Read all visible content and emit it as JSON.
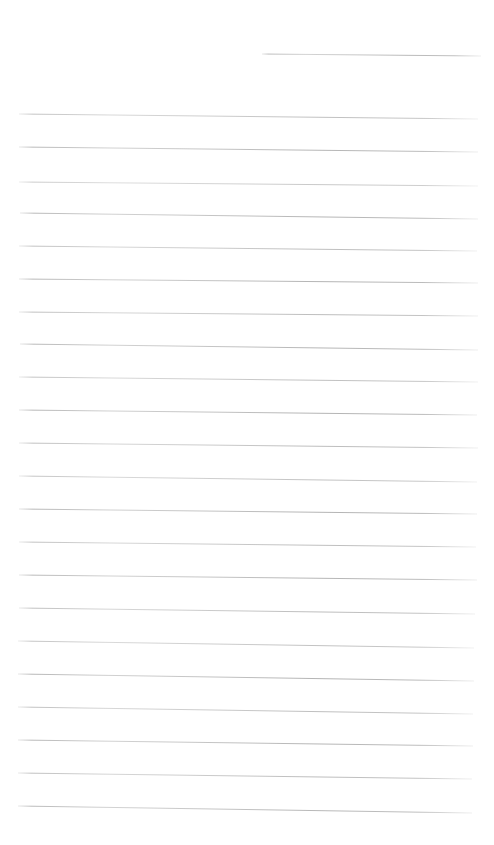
{
  "document": {
    "kind": "scanned-ruled-notebook-paper",
    "title": "Blank Ruled Paper",
    "page_width": 494,
    "page_height": 845,
    "background_color": "#ffffff",
    "ink_color": "#a3a3a3",
    "text_content": "",
    "has_handwriting": false,
    "line_count": 23,
    "line_spacing_px": 32.5,
    "rules": [
      {
        "index": 1,
        "x1": 262,
        "y1": 54,
        "x2": 481,
        "y2": 56,
        "width": 0.95,
        "opacity": 0.8,
        "note": "short indented header rule"
      },
      {
        "index": 2,
        "x1": 19,
        "y1": 114,
        "x2": 478,
        "y2": 119,
        "width": 0.95,
        "opacity": 0.72
      },
      {
        "index": 3,
        "x1": 19,
        "y1": 147,
        "x2": 478,
        "y2": 152,
        "width": 1.0,
        "opacity": 0.8
      },
      {
        "index": 4,
        "x1": 19,
        "y1": 182,
        "x2": 478,
        "y2": 186,
        "width": 0.9,
        "opacity": 0.66
      },
      {
        "index": 5,
        "x1": 20,
        "y1": 213,
        "x2": 478,
        "y2": 219,
        "width": 1.0,
        "opacity": 0.8
      },
      {
        "index": 6,
        "x1": 19,
        "y1": 246,
        "x2": 477,
        "y2": 251,
        "width": 0.95,
        "opacity": 0.74
      },
      {
        "index": 7,
        "x1": 19,
        "y1": 279,
        "x2": 478,
        "y2": 283,
        "width": 1.0,
        "opacity": 0.82
      },
      {
        "index": 8,
        "x1": 19,
        "y1": 312,
        "x2": 478,
        "y2": 316,
        "width": 0.95,
        "opacity": 0.76
      },
      {
        "index": 9,
        "x1": 20,
        "y1": 344,
        "x2": 478,
        "y2": 350,
        "width": 1.0,
        "opacity": 0.8
      },
      {
        "index": 10,
        "x1": 19,
        "y1": 377,
        "x2": 478,
        "y2": 382,
        "width": 0.95,
        "opacity": 0.72
      },
      {
        "index": 11,
        "x1": 19,
        "y1": 410,
        "x2": 477,
        "y2": 415,
        "width": 1.0,
        "opacity": 0.82
      },
      {
        "index": 12,
        "x1": 19,
        "y1": 443,
        "x2": 478,
        "y2": 448,
        "width": 0.95,
        "opacity": 0.76
      },
      {
        "index": 13,
        "x1": 19,
        "y1": 476,
        "x2": 477,
        "y2": 482,
        "width": 0.95,
        "opacity": 0.7
      },
      {
        "index": 14,
        "x1": 19,
        "y1": 509,
        "x2": 477,
        "y2": 514,
        "width": 1.0,
        "opacity": 0.82
      },
      {
        "index": 15,
        "x1": 19,
        "y1": 542,
        "x2": 476,
        "y2": 547,
        "width": 0.95,
        "opacity": 0.74
      },
      {
        "index": 16,
        "x1": 19,
        "y1": 575,
        "x2": 477,
        "y2": 580,
        "width": 1.0,
        "opacity": 0.8
      },
      {
        "index": 17,
        "x1": 19,
        "y1": 608,
        "x2": 475,
        "y2": 614,
        "width": 0.95,
        "opacity": 0.76
      },
      {
        "index": 18,
        "x1": 18,
        "y1": 641,
        "x2": 474,
        "y2": 648,
        "width": 0.95,
        "opacity": 0.7
      },
      {
        "index": 19,
        "x1": 18,
        "y1": 674,
        "x2": 474,
        "y2": 681,
        "width": 1.0,
        "opacity": 0.82
      },
      {
        "index": 20,
        "x1": 18,
        "y1": 707,
        "x2": 473,
        "y2": 714,
        "width": 0.95,
        "opacity": 0.74
      },
      {
        "index": 21,
        "x1": 18,
        "y1": 740,
        "x2": 473,
        "y2": 746,
        "width": 1.0,
        "opacity": 0.8
      },
      {
        "index": 22,
        "x1": 18,
        "y1": 773,
        "x2": 472,
        "y2": 779,
        "width": 0.95,
        "opacity": 0.76
      },
      {
        "index": 23,
        "x1": 18,
        "y1": 806,
        "x2": 472,
        "y2": 813,
        "width": 1.0,
        "opacity": 0.78
      }
    ]
  }
}
